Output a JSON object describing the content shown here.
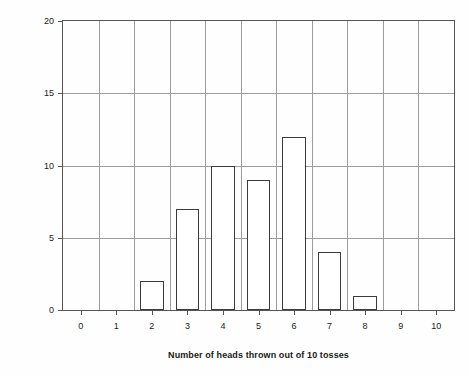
{
  "chart_data": {
    "type": "bar",
    "title": "",
    "xlabel": "Number of heads thrown out of 10 tosses",
    "ylabel": "Number of trials",
    "categories": [
      "0",
      "1",
      "2",
      "3",
      "4",
      "5",
      "6",
      "7",
      "8",
      "9",
      "10"
    ],
    "values": [
      0,
      0,
      2,
      7,
      10,
      9,
      12,
      4,
      1,
      0,
      0
    ],
    "xlim": [
      -0.5,
      10.5
    ],
    "ylim": [
      0,
      20
    ],
    "ytick_labels": [
      "0",
      "5",
      "10",
      "15",
      "20"
    ],
    "ytick_values": [
      0,
      5,
      10,
      15,
      20
    ],
    "xtick_labels": [
      "0",
      "1",
      "2",
      "3",
      "4",
      "5",
      "6",
      "7",
      "8",
      "9",
      "10"
    ],
    "grid": "both",
    "legend": "none",
    "bar_fill_color": "#ffffff",
    "bar_edge_color": "#3b3b3b",
    "gridline_color": "#9c9c9c",
    "axis_color": "#555555",
    "background_color": "#fefefe"
  }
}
